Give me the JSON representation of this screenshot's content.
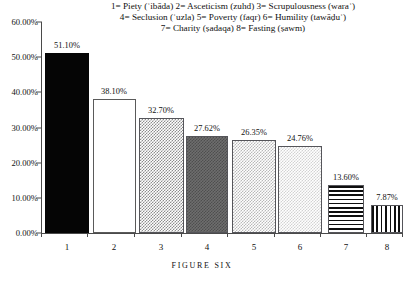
{
  "chart_data": {
    "type": "bar",
    "title": "",
    "caption": "FIGURE SIX",
    "xlabel": "",
    "ylabel": "",
    "ylim": [
      0,
      60
    ],
    "grid": false,
    "legend_position": "top-center",
    "categories": [
      "1",
      "2",
      "3",
      "4",
      "5",
      "6",
      "7",
      "8"
    ],
    "values": [
      51.1,
      38.1,
      32.7,
      27.62,
      26.35,
      24.76,
      13.6,
      7.87
    ],
    "data_labels": [
      "51.10%",
      "38.10%",
      "32.70%",
      "27.62%",
      "26.35%",
      "24.76%",
      "13.60%",
      "7.87%"
    ],
    "bar_fills": [
      "solid-black",
      "white",
      "checker-medium",
      "checker-dark",
      "checker-light",
      "checker-lighter",
      "horizontal-stripes",
      "vertical-stripes"
    ],
    "ytick_labels": [
      "0.00%",
      "10.00%",
      "20.00%",
      "30.00%",
      "40.00%",
      "50.00%",
      "60.00%"
    ],
    "ytick_values": [
      0,
      10,
      20,
      30,
      40,
      50,
      60
    ],
    "series_names": [
      "Piety (ʿibāda)",
      "Asceticism (zuhd)",
      "Scrupulousness (waraʿ)",
      "Seclusion (ʿuzla)",
      "Poverty (faqr)",
      "Humility (tawāḍuʿ)",
      "Charity (ṣadaqa)",
      "Fasting (ṣawm)"
    ],
    "legend_lines": [
      "1= Piety (ʿibāda)  2= Asceticism (zuhd)  3= Scrupulousness (waraʿ)",
      "4= Seclusion (ʿuzla)  5= Poverty (faqr)  6= Humility (tawāḍuʿ)",
      "7= Charity (ṣadaqa)  8= Fasting (ṣawm)"
    ]
  },
  "colors": {
    "axis": "#4a4a4a",
    "text": "#111111",
    "background": "#ffffff",
    "bar_outline": "#55555a"
  }
}
